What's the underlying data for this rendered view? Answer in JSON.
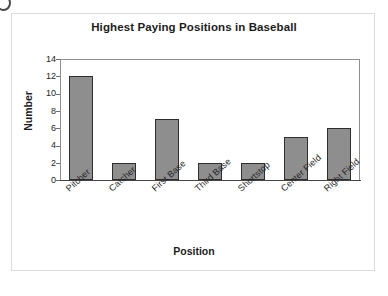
{
  "figure": {
    "background_color": "#ffffff",
    "frame_color": "#dcdcdc",
    "scan_mark": "corner-arc-artifact"
  },
  "chart_data": {
    "type": "bar",
    "title": "Highest Paying Positions in Baseball",
    "xlabel": "Position",
    "ylabel": "Number",
    "categories": [
      "Pitcher",
      "Catcher",
      "First Base",
      "Third Base",
      "Shortstop",
      "Center Field",
      "Right Field"
    ],
    "values": [
      12,
      2,
      7,
      2,
      2,
      5,
      6
    ],
    "ylim": [
      0,
      14
    ],
    "ytick_labels": [
      "14",
      "12",
      "10",
      "8",
      "6",
      "4",
      "2",
      "0"
    ],
    "ytick_values": [
      14,
      12,
      10,
      8,
      6,
      4,
      2,
      0
    ],
    "ytick_step": 2,
    "grid": false,
    "legend": null,
    "bar_fill_color": "#8e8e8e",
    "bar_edge_color": "#2e2e2e",
    "axis_color": "#8e8e8e",
    "xtick_label_rotation": -42
  }
}
